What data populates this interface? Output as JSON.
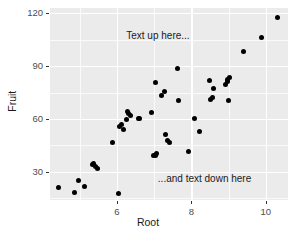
{
  "chart_data": {
    "type": "scatter",
    "title": "",
    "xlabel": "Root",
    "ylabel": "Fruit",
    "xlim": [
      4.2,
      10.6
    ],
    "ylim": [
      14,
      123
    ],
    "xticks": [
      6,
      8,
      10
    ],
    "yticks": [
      30,
      60,
      90,
      120
    ],
    "grid": true,
    "legend": null,
    "point_color": "#000000",
    "panel_color": "#ebebeb",
    "grid_color": "#ffffff",
    "annotations": [
      {
        "text": "Text up here...",
        "x": 6.25,
        "y": 107,
        "name": "annotation-top"
      },
      {
        "text": "...and text down here",
        "x": 7.1,
        "y": 26,
        "name": "annotation-bottom"
      }
    ],
    "points": [
      {
        "x": 4.43,
        "y": 21.0
      },
      {
        "x": 4.87,
        "y": 18.0
      },
      {
        "x": 4.97,
        "y": 25.0
      },
      {
        "x": 5.12,
        "y": 21.5
      },
      {
        "x": 5.33,
        "y": 34.0
      },
      {
        "x": 5.38,
        "y": 34.5
      },
      {
        "x": 5.42,
        "y": 33.0
      },
      {
        "x": 5.47,
        "y": 32.0
      },
      {
        "x": 5.87,
        "y": 46.5
      },
      {
        "x": 6.05,
        "y": 17.5
      },
      {
        "x": 6.06,
        "y": 56.0
      },
      {
        "x": 6.12,
        "y": 57.0
      },
      {
        "x": 6.18,
        "y": 54.0
      },
      {
        "x": 6.25,
        "y": 59.5
      },
      {
        "x": 6.28,
        "y": 64.5
      },
      {
        "x": 6.31,
        "y": 63.0
      },
      {
        "x": 6.36,
        "y": 62.0
      },
      {
        "x": 6.57,
        "y": 60.5
      },
      {
        "x": 6.6,
        "y": 60.0
      },
      {
        "x": 6.94,
        "y": 63.5
      },
      {
        "x": 6.99,
        "y": 39.0
      },
      {
        "x": 7.03,
        "y": 39.5
      },
      {
        "x": 7.07,
        "y": 40.5
      },
      {
        "x": 7.04,
        "y": 80.5
      },
      {
        "x": 7.2,
        "y": 73.5
      },
      {
        "x": 7.28,
        "y": 75.5
      },
      {
        "x": 7.3,
        "y": 51.0
      },
      {
        "x": 7.37,
        "y": 47.5
      },
      {
        "x": 7.41,
        "y": 46.5
      },
      {
        "x": 7.62,
        "y": 88.5
      },
      {
        "x": 7.65,
        "y": 70.5
      },
      {
        "x": 7.92,
        "y": 41.5
      },
      {
        "x": 8.08,
        "y": 60.5
      },
      {
        "x": 8.21,
        "y": 53.0
      },
      {
        "x": 8.5,
        "y": 82.0
      },
      {
        "x": 8.52,
        "y": 71.0
      },
      {
        "x": 8.56,
        "y": 72.0
      },
      {
        "x": 8.61,
        "y": 77.5
      },
      {
        "x": 8.93,
        "y": 79.5
      },
      {
        "x": 8.96,
        "y": 82.5
      },
      {
        "x": 8.98,
        "y": 81.0
      },
      {
        "x": 9.02,
        "y": 83.5
      },
      {
        "x": 8.99,
        "y": 70.5
      },
      {
        "x": 9.41,
        "y": 98.5
      },
      {
        "x": 9.88,
        "y": 106.0
      },
      {
        "x": 10.33,
        "y": 117.5
      }
    ]
  }
}
